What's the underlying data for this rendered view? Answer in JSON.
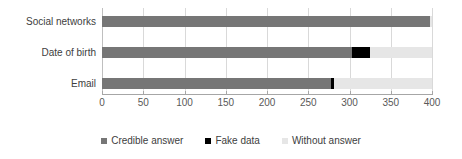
{
  "chart_data": {
    "type": "bar",
    "orientation": "horizontal",
    "stacked": true,
    "title": "",
    "subtitle": "",
    "xlabel": "",
    "ylabel": "",
    "categories": [
      "Social networks",
      "Date of birth",
      "Email"
    ],
    "series": [
      {
        "name": "Credible answer",
        "color": "#767676",
        "values": [
          397,
          303,
          278
        ]
      },
      {
        "name": "Fake data",
        "color": "#000000",
        "values": [
          0,
          22,
          3
        ]
      },
      {
        "name": "Without answer",
        "color": "#e6e6e6",
        "values": [
          3,
          75,
          119
        ]
      }
    ],
    "xlim": [
      0,
      400
    ],
    "xticks": [
      0,
      50,
      100,
      150,
      200,
      250,
      300,
      350,
      400
    ],
    "xtick_labels": [
      "0",
      "50",
      "100",
      "150",
      "200",
      "250",
      "300",
      "350",
      "400"
    ],
    "grid": true,
    "grid_axis": "x",
    "legend_position": "bottom",
    "legend_entries": [
      "Credible answer",
      "Fake data",
      "Without answer"
    ],
    "colors": {
      "credible_answer": "#767676",
      "fake_data": "#000000",
      "without_answer": "#e6e6e6",
      "gridline": "#d9d9d9",
      "axis_line": "#a6a6a6",
      "text": "#404040",
      "tick_text": "#595959",
      "background": "#ffffff"
    }
  }
}
